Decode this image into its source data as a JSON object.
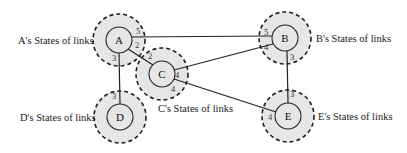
{
  "colors": {
    "halo_fill": "#e6e6e6",
    "stroke": "#222222",
    "background": "#ffffff"
  },
  "nodes": [
    {
      "id": "A",
      "label": "A",
      "cx": 119,
      "cy": 40,
      "state_label": "A's States of links",
      "label_x": 18,
      "label_y": 44,
      "anchor": "start"
    },
    {
      "id": "B",
      "label": "B",
      "cx": 285,
      "cy": 38,
      "state_label": "B's States of links",
      "label_x": 316,
      "label_y": 42,
      "anchor": "start"
    },
    {
      "id": "C",
      "label": "C",
      "cx": 162,
      "cy": 74,
      "state_label": "C's States of links",
      "label_x": 158,
      "label_y": 112,
      "anchor": "start"
    },
    {
      "id": "D",
      "label": "D",
      "cx": 120,
      "cy": 117,
      "state_label": "D's States of links",
      "label_x": 20,
      "label_y": 121,
      "anchor": "start"
    },
    {
      "id": "E",
      "label": "E",
      "cx": 288,
      "cy": 116,
      "state_label": "E's States of links",
      "label_x": 318,
      "label_y": 120,
      "anchor": "start"
    }
  ],
  "links": [
    {
      "from": "A",
      "to": "B",
      "x1": 132,
      "y1": 37,
      "x2": 272,
      "y2": 36
    },
    {
      "from": "A",
      "to": "C",
      "x1": 128,
      "y1": 49,
      "x2": 153,
      "y2": 65
    },
    {
      "from": "A",
      "to": "D",
      "x1": 119,
      "y1": 53,
      "x2": 120,
      "y2": 104
    },
    {
      "from": "C",
      "to": "B",
      "x1": 174,
      "y1": 70,
      "x2": 273,
      "y2": 44
    },
    {
      "from": "C",
      "to": "E",
      "x1": 174,
      "y1": 79,
      "x2": 276,
      "y2": 112
    },
    {
      "from": "B",
      "to": "E",
      "x1": 287,
      "y1": 51,
      "x2": 288,
      "y2": 103
    }
  ],
  "link_numbers": [
    {
      "text": "5",
      "x": 136,
      "y": 34
    },
    {
      "text": "2",
      "x": 135,
      "y": 48
    },
    {
      "text": "3",
      "x": 112,
      "y": 61
    },
    {
      "text": "5",
      "x": 264,
      "y": 35
    },
    {
      "text": "4",
      "x": 264,
      "y": 50
    },
    {
      "text": "3",
      "x": 290,
      "y": 60
    },
    {
      "text": "2",
      "x": 148,
      "y": 59
    },
    {
      "text": "4",
      "x": 175,
      "y": 78
    },
    {
      "text": "4",
      "x": 171,
      "y": 92
    },
    {
      "text": "3",
      "x": 112,
      "y": 99
    },
    {
      "text": "4",
      "x": 268,
      "y": 120
    },
    {
      "text": "3",
      "x": 290,
      "y": 97
    }
  ]
}
